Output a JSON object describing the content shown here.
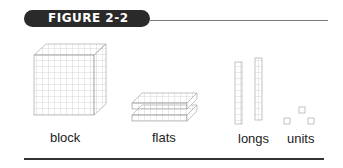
{
  "figure": {
    "title": "Figure 2-2",
    "title_display": "FIGURE 2-2"
  },
  "items": [
    {
      "label": "block"
    },
    {
      "label": "flats"
    },
    {
      "label": "longs"
    },
    {
      "label": "units"
    }
  ],
  "colors": {
    "badge_bg": "#2a2a2a",
    "grid_line": "#bbbbbb",
    "rule": "#333333"
  }
}
